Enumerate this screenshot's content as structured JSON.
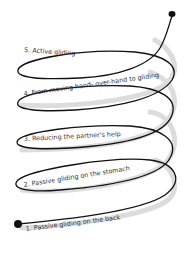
{
  "diagram": {
    "type": "spiral-steps",
    "line_color": "#111111",
    "shadow_color": "#d9d9d9",
    "text_color": "#333333",
    "steps": [
      {
        "number": "1.",
        "label": "Passive gliding on the back"
      },
      {
        "number": "2.",
        "label": "Passive gliding on the stomach"
      },
      {
        "number": "3.",
        "label": "Reducing the partner's help"
      },
      {
        "number": "4.",
        "label": "From moving hand- over-hand to gliding"
      },
      {
        "number": "5.",
        "label": "Active gliding"
      }
    ],
    "start_marker": "filled-dot-bottom-left",
    "end_marker": "filled-dot-top-right"
  }
}
